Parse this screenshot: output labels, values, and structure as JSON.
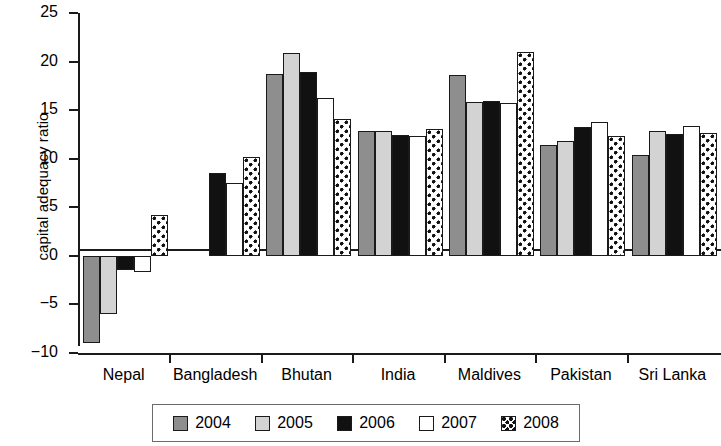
{
  "chart_data": {
    "type": "bar",
    "title": "",
    "subtitle": "",
    "xlabel": "",
    "ylabel": "capital adequacy ratio",
    "categories": [
      "Nepal",
      "Bangladesh",
      "Bhutan",
      "India",
      "Maldives",
      "Pakistan",
      "Sri Lanka"
    ],
    "series": [
      {
        "name": "2004",
        "values": [
          -9.0,
          null,
          18.7,
          12.9,
          18.6,
          11.4,
          10.4
        ]
      },
      {
        "name": "2005",
        "values": [
          -6.0,
          null,
          20.9,
          12.9,
          15.8,
          11.8,
          12.9
        ]
      },
      {
        "name": "2006",
        "values": [
          -1.5,
          8.5,
          18.9,
          12.4,
          15.9,
          13.3,
          12.5
        ]
      },
      {
        "name": "2007",
        "values": [
          -1.7,
          7.5,
          16.2,
          12.3,
          15.7,
          13.8,
          13.4
        ]
      },
      {
        "name": "2008",
        "values": [
          4.2,
          10.2,
          14.1,
          13.1,
          21.0,
          12.3,
          12.6
        ]
      }
    ],
    "ylim": [
      -10,
      25
    ],
    "yticks": [
      25,
      20,
      15,
      10,
      5,
      0,
      -5,
      -10
    ],
    "ytick_labels": [
      "25",
      "20",
      "15",
      "10",
      "5",
      "0",
      "−5",
      "−10"
    ],
    "grid": false,
    "legend_position": "bottom",
    "legend_entries": [
      {
        "label": "2004",
        "swatch": "dark-gray-fill",
        "color": "#8e8e8e"
      },
      {
        "label": "2005",
        "swatch": "light-gray-fill",
        "color": "#d3d3d3"
      },
      {
        "label": "2006",
        "swatch": "black-fill",
        "color": "#111111"
      },
      {
        "label": "2007",
        "swatch": "white-fill",
        "color": "#ffffff"
      },
      {
        "label": "2008",
        "swatch": "dotted-pattern",
        "color": "#ffffff"
      }
    ]
  }
}
